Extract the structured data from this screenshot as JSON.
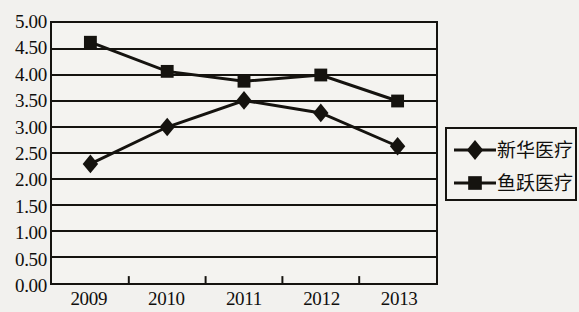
{
  "chart_data": {
    "type": "line",
    "title": "",
    "xlabel": "",
    "ylabel": "",
    "categories": [
      "2009",
      "2010",
      "2011",
      "2012",
      "2013"
    ],
    "ylim": [
      0,
      5
    ],
    "ytick_labels": [
      "5.00",
      "4.50",
      "4.00",
      "3.50",
      "3.00",
      "2.50",
      "2.00",
      "1.50",
      "1.00",
      "0.50",
      "0.00"
    ],
    "ytick_values": [
      5.0,
      4.5,
      4.0,
      3.5,
      3.0,
      2.5,
      2.0,
      1.5,
      1.0,
      0.5,
      0.0
    ],
    "grid": true,
    "grid_axis": "y",
    "legend_position": "right",
    "series": [
      {
        "name": "新华医疗",
        "marker": "diamond",
        "color": "#15130f",
        "values": [
          2.29,
          3.0,
          3.51,
          3.27,
          2.63
        ]
      },
      {
        "name": "鱼跃医疗",
        "marker": "square",
        "color": "#15130f",
        "values": [
          4.63,
          4.07,
          3.88,
          4.0,
          3.5
        ]
      }
    ]
  },
  "legend": {
    "items": [
      {
        "label": "新华医疗",
        "marker": "diamond"
      },
      {
        "label": "鱼跃医疗",
        "marker": "square"
      }
    ]
  },
  "colors": {
    "line": "#15130f",
    "grid": "#15130f",
    "axis": "#15130f",
    "background": "#f2f1ee",
    "plot_background": "#f4f3f0",
    "text": "#100f0d"
  }
}
